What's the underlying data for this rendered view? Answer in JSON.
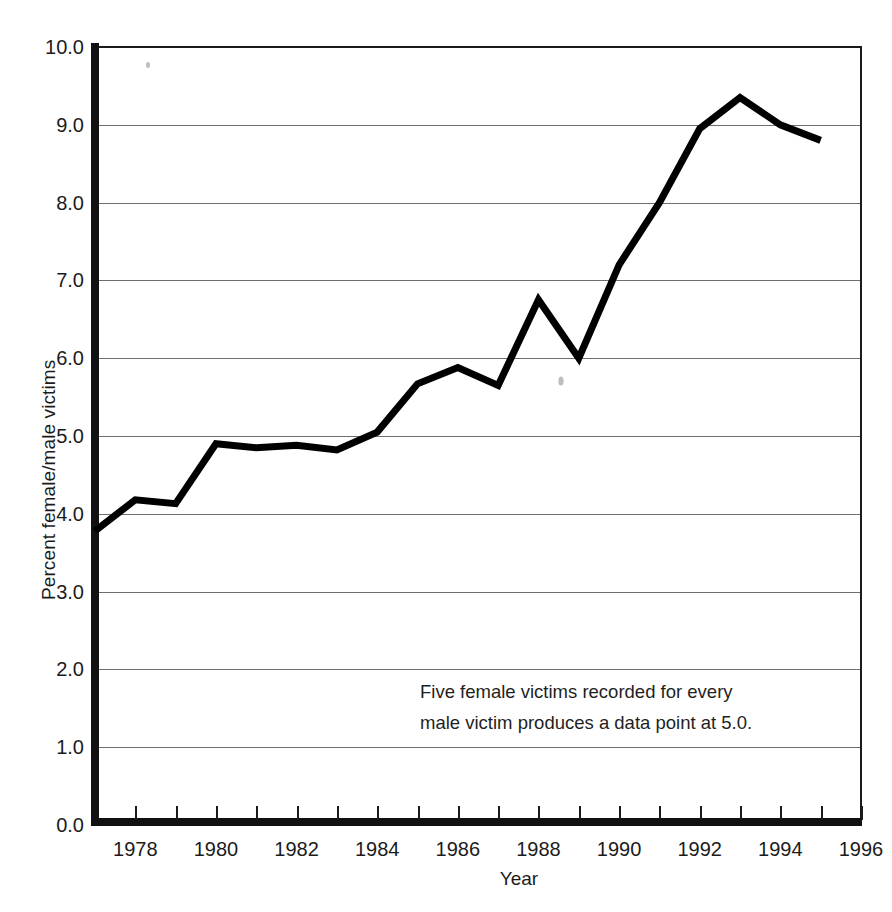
{
  "chart_data": {
    "type": "line",
    "title": "",
    "subtitle": "",
    "xlabel": "Year",
    "ylabel": "Percent female/male victims",
    "xlim": [
      1977,
      1996
    ],
    "ylim": [
      0.0,
      10.0
    ],
    "grid": true,
    "grid_axis": "y",
    "legend": "none",
    "line_color": "#000000",
    "line_width_px": 7,
    "x_tick_labels": [
      "1978",
      "1980",
      "1982",
      "1984",
      "1986",
      "1988",
      "1990",
      "1992",
      "1994",
      "1996"
    ],
    "x_tick_values": [
      1978,
      1980,
      1982,
      1984,
      1986,
      1988,
      1990,
      1992,
      1994,
      1996
    ],
    "x_minor_tick_values": [
      1977,
      1978,
      1979,
      1980,
      1981,
      1982,
      1983,
      1984,
      1985,
      1986,
      1987,
      1988,
      1989,
      1990,
      1991,
      1992,
      1993,
      1994,
      1995,
      1996
    ],
    "y_tick_labels": [
      "0.0",
      "1.0",
      "2.0",
      "3.0",
      "4.0",
      "5.0",
      "6.0",
      "7.0",
      "8.0",
      "9.0",
      "10.0"
    ],
    "y_tick_values": [
      0.0,
      1.0,
      2.0,
      3.0,
      4.0,
      5.0,
      6.0,
      7.0,
      8.0,
      9.0,
      10.0
    ],
    "x": [
      1977,
      1978,
      1979,
      1980,
      1981,
      1982,
      1983,
      1984,
      1985,
      1986,
      1987,
      1988,
      1989,
      1990,
      1991,
      1992,
      1993,
      1994,
      1995
    ],
    "values": [
      3.78,
      4.18,
      4.13,
      4.9,
      4.85,
      4.88,
      4.82,
      5.05,
      5.67,
      5.88,
      5.65,
      6.75,
      6.0,
      7.2,
      8.0,
      8.95,
      9.35,
      9.0,
      8.8
    ],
    "annotations": [
      {
        "id": "five-to-one-note",
        "line1": "Five female victims recorded for every",
        "line2": "male victim produces a data point at 5.0."
      }
    ]
  },
  "annotation": {
    "line1": "Five female victims recorded for every",
    "line2": "male victim produces a data point at 5.0."
  },
  "axes": {
    "x_title": "Year",
    "y_title": "Percent female/male victims"
  }
}
